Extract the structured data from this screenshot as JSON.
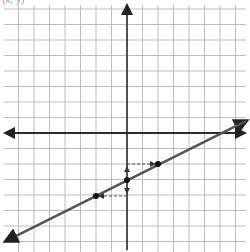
{
  "figure": {
    "caption_fragment": "(x, y)",
    "grid": {
      "spacing_px": 15.5,
      "color": "#bdbdbd",
      "origin_px": [
        127,
        133
      ]
    },
    "axes": {
      "color": "#222222",
      "x_axis_arrows": "both",
      "y_axis_arrows": "both"
    },
    "line": {
      "color": "#555555",
      "slope": 0.5,
      "y_intercept": -3,
      "direction": "rising left-to-right"
    },
    "points": [
      {
        "name": "left-point",
        "x": -2,
        "y": -4
      },
      {
        "name": "y-intercept",
        "x": 0,
        "y": -3
      },
      {
        "name": "right-point",
        "x": 2,
        "y": -2
      }
    ],
    "annotations": [
      {
        "type": "dashed-arrow",
        "from": [
          0,
          -2
        ],
        "to": [
          2,
          -2
        ],
        "meaning": "run +2"
      },
      {
        "type": "dashed-arrow",
        "from": [
          0,
          -4
        ],
        "to": [
          -2,
          -4
        ],
        "meaning": "run -2"
      },
      {
        "type": "arrow",
        "from": [
          0,
          -3
        ],
        "to": [
          0,
          -2
        ],
        "meaning": "rise +1"
      },
      {
        "type": "arrow",
        "from": [
          0,
          -3
        ],
        "to": [
          0,
          -4
        ],
        "meaning": "rise -1"
      }
    ]
  }
}
